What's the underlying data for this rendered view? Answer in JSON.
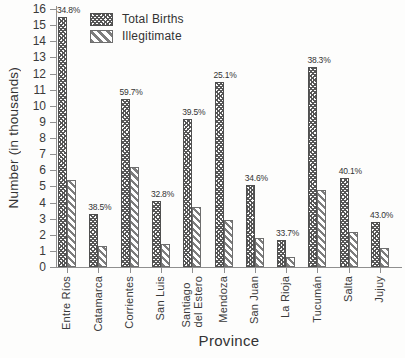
{
  "chart_data": {
    "type": "bar",
    "title": "",
    "xlabel": "Province",
    "ylabel": "Number (in thousands)",
    "ylim": [
      0,
      16
    ],
    "ytick_step": 1,
    "grid": false,
    "legend_position": "top-left-inside",
    "categories": [
      "Entre Ríos",
      "Catamarca",
      "Corrientes",
      "San Luis",
      "Santiago\ndel Estero",
      "Mendoza",
      "San Juan",
      "La Rioja",
      "Tucumán",
      "Salta",
      "Jujuy"
    ],
    "series": [
      {
        "name": "Total Births",
        "hatch": "crosshatch",
        "color": "#565656",
        "values": [
          15.5,
          3.3,
          10.4,
          4.1,
          9.2,
          11.5,
          5.1,
          1.7,
          12.4,
          5.5,
          2.8
        ]
      },
      {
        "name": "Illegitimate",
        "hatch": "diagonal-backslash",
        "color": "#7d7d7d",
        "values": [
          5.4,
          1.3,
          6.2,
          1.4,
          3.7,
          2.9,
          1.8,
          0.6,
          4.8,
          2.2,
          1.2
        ]
      }
    ],
    "bar_labels": [
      "34.8%",
      "38.5%",
      "59.7%",
      "32.8%",
      "39.5%",
      "25.1%",
      "34.6%",
      "33.7%",
      "38.3%",
      "40.1%",
      "43.0%"
    ],
    "bar_labels_note": "percent shown above each Total Births bar",
    "colors": {
      "axis": "#8f8f8f",
      "text": "#333333",
      "background": "#fdfdfc"
    }
  }
}
